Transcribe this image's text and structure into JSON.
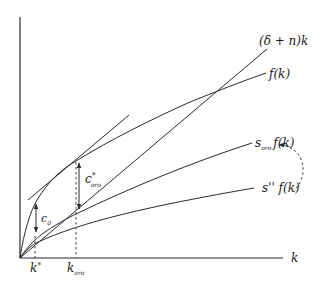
{
  "diagram": {
    "axes": {
      "x_label": "k",
      "y_label": ""
    },
    "curves": {
      "depreciation_line_label": "(δ + n)k",
      "production_label": "f(k)",
      "savings_golden_label_s": "s",
      "savings_golden_label_sub": "oro",
      "savings_golden_label_fk": "f(k)",
      "savings_low_label": "s'' f(k)"
    },
    "annotations": {
      "c0_main": "c",
      "c0_sub": "0",
      "c_golden_main": "c",
      "c_golden_sup": "*",
      "c_golden_sub": "oro"
    },
    "x_ticks": {
      "k_star_main": "k",
      "k_star_sup": "*",
      "k_golden_main": "k",
      "k_golden_sub": "oro"
    },
    "colors": {
      "ink": "#2a2a2a",
      "background": "#ffffff"
    }
  }
}
